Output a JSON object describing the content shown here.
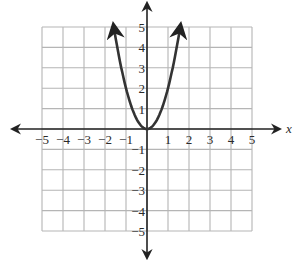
{
  "chart_data": {
    "type": "line",
    "title": "",
    "xlabel": "x",
    "ylabel": "",
    "xlim": [
      -5,
      5
    ],
    "ylim": [
      -5,
      5
    ],
    "grid": true,
    "x_ticks": [
      -5,
      -4,
      -3,
      -2,
      -1,
      1,
      2,
      3,
      4,
      5
    ],
    "x_tick_labels": [
      "−5",
      "−4",
      "−3",
      "−2",
      "−1",
      "1",
      "2",
      "3",
      "4",
      "5"
    ],
    "y_ticks": [
      5,
      4,
      3,
      2,
      1,
      -1,
      -2,
      -3,
      -4,
      -5
    ],
    "y_tick_labels": [
      "5",
      "4",
      "3",
      "2",
      "1",
      "−1",
      "−2",
      "−3",
      "−4",
      "−5"
    ],
    "series": [
      {
        "name": "parabola",
        "equation": "y = 2x^2",
        "vertex": [
          0,
          0
        ],
        "x": [
          -1.6,
          -1.5,
          -1.25,
          -1,
          -0.75,
          -0.5,
          -0.25,
          0,
          0.25,
          0.5,
          0.75,
          1,
          1.25,
          1.5,
          1.6
        ],
        "y": [
          5.12,
          4.5,
          3.125,
          2,
          1.125,
          0.5,
          0.125,
          0,
          0.125,
          0.5,
          1.125,
          2,
          3.125,
          4.5,
          5.12
        ],
        "arrows_both_ends": true
      }
    ],
    "legend": null,
    "colors": {
      "grid": "#b5b5b5",
      "axes": "#222222",
      "curve": "#333333"
    }
  }
}
